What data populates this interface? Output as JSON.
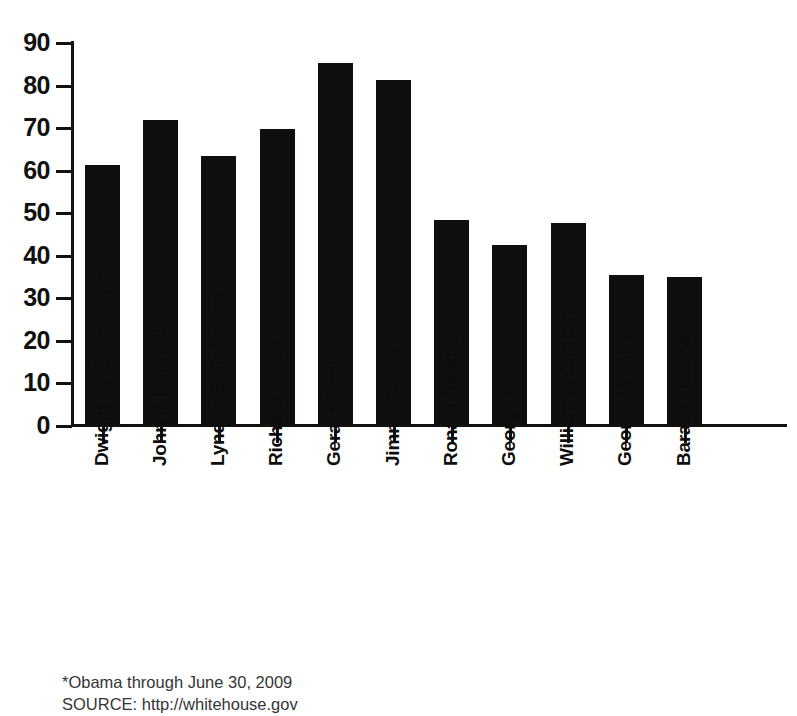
{
  "chart_data": {
    "type": "bar",
    "title": "",
    "subtitle": "",
    "xlabel": "",
    "ylabel": "",
    "categories": [
      "Dwight D. Eisenhower",
      "John F. Kennedy",
      "Lyndon B. Johnson",
      "Richard Nixon",
      "Gerald Ford",
      "Jimmy Carter",
      "Ronald Reagan",
      "George H.W. Bush",
      "William J. Clinton",
      "George W. Bush",
      "Barack Obama"
    ],
    "values": [
      61.3,
      71.8,
      63.5,
      69.7,
      85.2,
      81.2,
      48.3,
      42.5,
      47.6,
      35.5,
      35.0
    ],
    "ylim": [
      0,
      90
    ],
    "yticks": [
      0,
      10,
      20,
      30,
      40,
      50,
      60,
      70,
      80,
      90
    ],
    "ytick_labels": [
      "0",
      "10",
      "20",
      "30",
      "40",
      "50",
      "60",
      "70",
      "80",
      "90"
    ],
    "grid": false,
    "legend": null,
    "bar_color": "#100f0d",
    "axis_color": "#111111",
    "background": "#ffffff"
  },
  "footnote": {
    "line1": "*Obama through June 30, 2009",
    "line2": "SOURCE: http://whitehouse.gov"
  }
}
